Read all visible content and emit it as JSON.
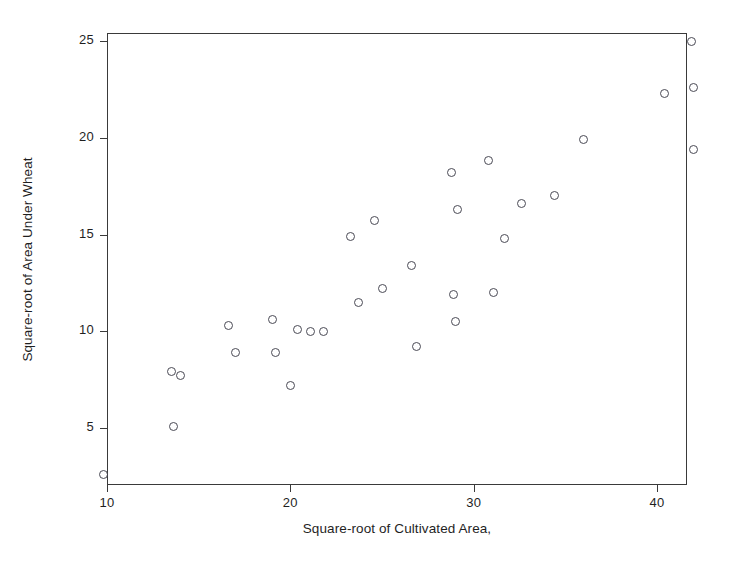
{
  "chart_data": {
    "type": "scatter",
    "title": "",
    "xlabel": "Square-root of Cultivated Area,",
    "ylabel": "Square-root of Area Under Wheat",
    "xlim": [
      9.2,
      42.8
    ],
    "ylim": [
      2.1,
      25.8
    ],
    "xticks": [
      10,
      20,
      30,
      40
    ],
    "yticks": [
      5,
      10,
      15,
      20,
      25
    ],
    "xtick_labels": [
      "10",
      "20",
      "30",
      "40"
    ],
    "ytick_labels": [
      "5",
      "10",
      "15",
      "20",
      "25"
    ],
    "grid": false,
    "legend": false,
    "marker": "open-circle",
    "marker_color": "#4a4a55",
    "points": [
      {
        "x": 9.8,
        "y": 2.6
      },
      {
        "x": 13.5,
        "y": 7.9
      },
      {
        "x": 14.0,
        "y": 7.7
      },
      {
        "x": 13.6,
        "y": 5.1
      },
      {
        "x": 16.6,
        "y": 10.3
      },
      {
        "x": 17.0,
        "y": 8.9
      },
      {
        "x": 19.0,
        "y": 10.6
      },
      {
        "x": 19.2,
        "y": 8.9
      },
      {
        "x": 20.0,
        "y": 7.2
      },
      {
        "x": 20.4,
        "y": 10.1
      },
      {
        "x": 21.1,
        "y": 10.0
      },
      {
        "x": 21.8,
        "y": 10.0
      },
      {
        "x": 23.3,
        "y": 14.9
      },
      {
        "x": 23.7,
        "y": 11.5
      },
      {
        "x": 24.6,
        "y": 15.7
      },
      {
        "x": 25.0,
        "y": 12.2
      },
      {
        "x": 26.6,
        "y": 13.4
      },
      {
        "x": 26.9,
        "y": 9.2
      },
      {
        "x": 28.8,
        "y": 18.2
      },
      {
        "x": 29.1,
        "y": 16.3
      },
      {
        "x": 28.9,
        "y": 11.9
      },
      {
        "x": 29.0,
        "y": 10.5
      },
      {
        "x": 30.8,
        "y": 18.8
      },
      {
        "x": 31.1,
        "y": 12.0
      },
      {
        "x": 31.7,
        "y": 14.8
      },
      {
        "x": 32.6,
        "y": 16.6
      },
      {
        "x": 34.4,
        "y": 17.0
      },
      {
        "x": 36.0,
        "y": 19.9
      },
      {
        "x": 40.4,
        "y": 22.3
      },
      {
        "x": 41.9,
        "y": 25.0
      },
      {
        "x": 42.0,
        "y": 22.6
      },
      {
        "x": 42.0,
        "y": 19.4
      }
    ]
  }
}
